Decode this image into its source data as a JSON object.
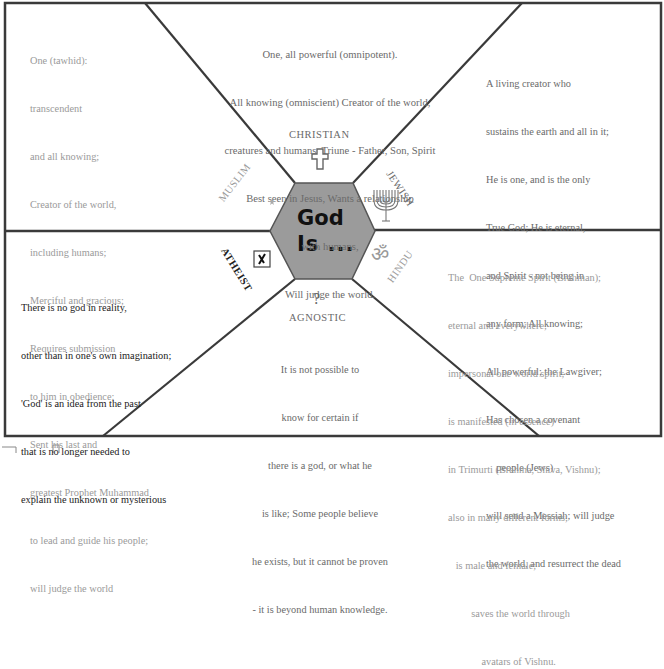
{
  "center": {
    "line1": "God",
    "line2": "Is ..."
  },
  "sections": {
    "christian": {
      "label": "CHRISTIAN",
      "icon": "cross-icon",
      "lines": [
        "One, all powerful (omnipotent).",
        "All knowing (omniscient) Creator of the world,",
        "creatures and humans. Triune - Father, Son, Spirit",
        "Best seen in Jesus, Wants a relationship",
        "with humans,",
        "Will judge the world."
      ]
    },
    "muslim": {
      "label": "MUSLIM",
      "icon": "crescent-star-icon",
      "lines": [
        "One (tawhid):",
        "transcendent",
        "and all knowing;",
        "Creator of the world,",
        "including humans;",
        "Merciful and gracious;",
        "Requires submission",
        "to him in obedience;",
        "Sent his last and",
        "greatest Prophet Muhammad",
        "to lead and guide his people;",
        "will judge the world"
      ]
    },
    "jewish": {
      "label": "JEWISH",
      "icon": "menorah-icon",
      "lines": [
        "A living creator who",
        "sustains the earth and all in it;",
        "He is one, and is the only",
        "True God; He is eternal,",
        "and Spirit - not being in",
        "any form; All knowing;",
        "All powerful; the Lawgiver;",
        "Has chosen a covenant",
        "    people (Jews)",
        "will send a Messiah; will judge",
        "the world, and resurrect the dead"
      ]
    },
    "atheist": {
      "label": "ATHEIST",
      "icon": "x-box-icon",
      "lines": [
        "There is no god in reality,",
        "other than in one's own imagination;",
        "'God' is an idea from the past",
        "that is no longer needed to",
        "explain the unknown or mysterious"
      ]
    },
    "hindu": {
      "label": "HINDU",
      "icon": "om-icon",
      "lines": [
        "The  One Supreme Spirit (Brahman);",
        "eternal and everywhere;",
        "impersonal one world spirit;",
        "is manifested (in essence)",
        "in Trimurti (Brahma, Shiva, Vishnu);",
        "also in many different forms;",
        "   is male and female;",
        "         saves the world through",
        "             avatars of Vishnu."
      ]
    },
    "agnostic": {
      "label": "AGNOSTIC",
      "icon": "question-mark-icon",
      "icon_glyph": "?",
      "lines": [
        "It is not possible to",
        "know for certain if",
        "there is a god, or what he",
        "is like; Some people believe",
        "he exists, but it cannot be proven",
        "- it is beyond human knowledge."
      ]
    }
  },
  "colors": {
    "border": "#3a3a3a",
    "hexagon_fill": "#9b9b9b",
    "faded_text": "#9a9a9a",
    "dark_text": "#222222"
  }
}
